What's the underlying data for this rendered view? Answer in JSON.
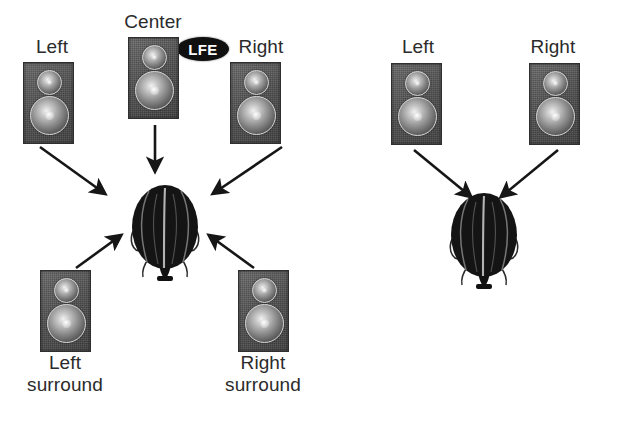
{
  "figure": {
    "background_color": "#ffffff",
    "text_color": "#2b2b2b",
    "speaker_color": "#575757",
    "head_color": "#111111",
    "arrow_color": "#161616"
  },
  "panels": [
    {
      "id": "surround",
      "name": "five-point-one-surround-panel",
      "labels": {
        "left": "Left",
        "center": "Center",
        "right": "Right",
        "lfe": "LFE",
        "left_surround_line1": "Left",
        "left_surround_line2": "surround",
        "right_surround_line1": "Right",
        "right_surround_line2": "surround"
      },
      "speakers": [
        "Left",
        "Center",
        "Right",
        "Left surround",
        "Right surround"
      ],
      "arrow_count": 5,
      "listener": "head-top-view"
    },
    {
      "id": "stereo",
      "name": "two-channel-stereo-panel",
      "labels": {
        "left": "Left",
        "right": "Right"
      },
      "speakers": [
        "Left",
        "Right"
      ],
      "arrow_count": 2,
      "listener": "head-top-view"
    }
  ],
  "caption": {
    "left_fragment": "",
    "right_fragment": ""
  }
}
